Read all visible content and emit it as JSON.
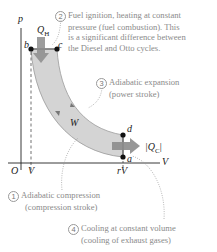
{
  "diagram": {
    "axes": {
      "y_label": "p",
      "x_label": "V",
      "origin_label": "O",
      "x_tick_1": "V",
      "x_tick_2": "rV"
    },
    "points": {
      "a": "a",
      "b": "b",
      "c": "c",
      "d": "d"
    },
    "heat_in": {
      "symbol": "Q",
      "subscript": "H"
    },
    "heat_out": {
      "symbol": "|Q",
      "subscript": "C",
      "close": "|"
    },
    "work_label": "W",
    "colors": {
      "band": "#d4d4d4",
      "band_edge": "#999999",
      "arrow": "#8c8c8c",
      "axis": "#222222",
      "point": "#111111",
      "annotation": "#8a8a8a"
    },
    "annotations": [
      {
        "num": "1",
        "lines": [
          "Adiabatic compression",
          "(compression stroke)"
        ]
      },
      {
        "num": "2",
        "lines": [
          "Fuel ignition, heating at constant",
          "pressure (fuel combustion).  This",
          "is a significant difference between",
          "the Diesel and Otto cycles."
        ]
      },
      {
        "num": "3",
        "lines": [
          "Adiabatic expansion",
          "(power stroke)"
        ]
      },
      {
        "num": "4",
        "lines": [
          "Cooling at constant volume",
          "(cooling of exhaust gases)"
        ]
      }
    ]
  }
}
